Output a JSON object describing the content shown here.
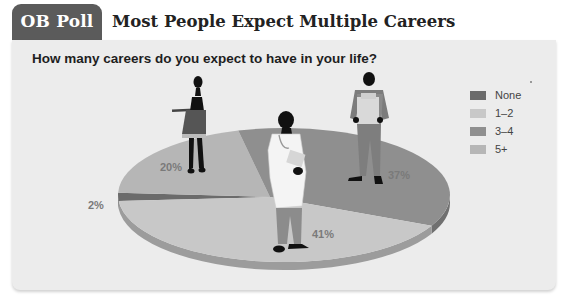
{
  "header": {
    "tab_label": "OB Poll",
    "headline": "Most People Expect Multiple Careers"
  },
  "chart_data": {
    "type": "pie",
    "title": "How many careers do you expect to have in your life?",
    "categories": [
      "None",
      "1–2",
      "3–4",
      "5+"
    ],
    "values": [
      2,
      41,
      37,
      20
    ],
    "labels": [
      "2%",
      "41%",
      "37%",
      "20%"
    ],
    "colors": [
      "#6b6b6b",
      "#c8c8c8",
      "#8f8f8f",
      "#b6b6b6"
    ],
    "legend_position": "right",
    "style": "3d-tilted",
    "illustrations": [
      "waitress-figure",
      "doctor-figure",
      "worker-with-box-figure"
    ]
  }
}
